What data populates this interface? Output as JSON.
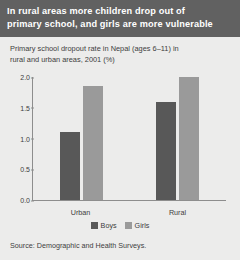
{
  "banner": {
    "line1": "In rural areas more children drop out of",
    "line2": "primary school, and girls are more vulnerable"
  },
  "subtitle": {
    "line1": "Primary school dropout rate in Nepal (ages 6–11) in",
    "line2": "rural and urban areas, 2001 (%)"
  },
  "source": "Source: Demographic and Health Surveys.",
  "colors": {
    "banner_bg": "#616161",
    "page_bg": "#ececeb",
    "boys": "#585858",
    "girls": "#9a9a9a",
    "axis": "#8d8d8d"
  },
  "legend": {
    "boys_label": "Boys",
    "girls_label": "Girls"
  },
  "chart_data": {
    "type": "bar",
    "title": "Primary school dropout rate in Nepal (ages 6–11) in rural and urban areas, 2001 (%)",
    "xlabel": "",
    "ylabel": "",
    "categories": [
      "Urban",
      "Rural"
    ],
    "series": [
      {
        "name": "Boys",
        "values": [
          1.1,
          1.6
        ],
        "color": "#585858"
      },
      {
        "name": "Girls",
        "values": [
          1.85,
          2.0
        ],
        "color": "#9a9a9a"
      }
    ],
    "ylim": [
      0.0,
      2.0
    ],
    "yticks": [
      "0.0",
      "0.5",
      "1.0",
      "1.5",
      "2.0"
    ],
    "ytick_values": [
      0.0,
      0.5,
      1.0,
      1.5,
      2.0
    ],
    "grid": false,
    "legend_position": "bottom-center"
  }
}
